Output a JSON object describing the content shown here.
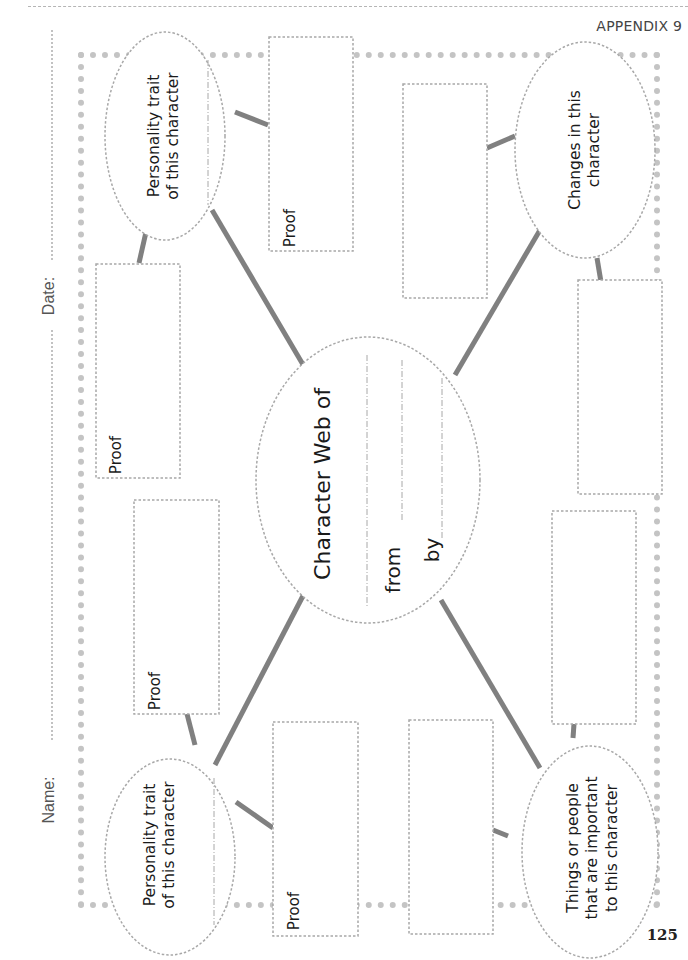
{
  "header": {
    "appendix_label": "APPENDIX 9",
    "page_number": "125"
  },
  "student_fields": {
    "name_label": "Name:",
    "date_label": "Date:"
  },
  "center": {
    "title": "Character Web of",
    "from_label": "from",
    "by_label": "by"
  },
  "ovals": {
    "top_left": "Personality trait of this character",
    "top_left_line1": "Personality trait",
    "top_left_line2": "of this character",
    "bottom_left_line1": "Personality trait",
    "bottom_left_line2": "of this character",
    "top_right_line1": "Changes in this",
    "top_right_line2": "character",
    "bottom_right_line1": "Things or people",
    "bottom_right_line2": "that are important",
    "bottom_right_line3": "to this character"
  },
  "proof_boxes": {
    "label": "Proof",
    "labels": [
      "Proof",
      "Proof",
      "Proof",
      "Proof"
    ]
  },
  "colors": {
    "frame_dots": "#c4c4c4",
    "connector": "#808080",
    "dashed_outline": "#a8a8a8",
    "text": "#1a1a1a"
  }
}
